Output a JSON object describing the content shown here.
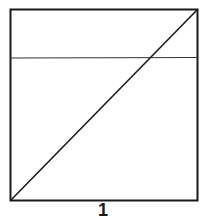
{
  "figure": {
    "label": "1",
    "square": {
      "x": 10,
      "y": 9,
      "width": 188,
      "height": 192
    },
    "horizontal_line_y": 58,
    "diagonal": {
      "from": "bottom-left",
      "to": "top-right"
    },
    "stroke_color": "#1a1a1a"
  }
}
